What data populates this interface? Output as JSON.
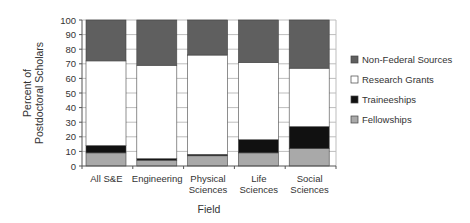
{
  "chart_data": {
    "type": "bar",
    "stacked": true,
    "title": "",
    "xlabel": "Field",
    "ylabel": "Percent of Postdoctoral Scholars",
    "ylabel_lines": [
      "Percent of",
      "Postdoctoral Scholars"
    ],
    "ylim": [
      0,
      100
    ],
    "yticks": [
      0,
      10,
      20,
      30,
      40,
      50,
      60,
      70,
      80,
      90,
      100
    ],
    "grid": true,
    "legend_position": "right",
    "categories": [
      "All S&E",
      "Engineering",
      "Physical Sciences",
      "Life Sciences",
      "Social Sciences"
    ],
    "category_lines": [
      [
        "All S&E"
      ],
      [
        "Engineering"
      ],
      [
        "Physical",
        "Sciences"
      ],
      [
        "Life",
        "Sciences"
      ],
      [
        "Social",
        "Sciences"
      ]
    ],
    "series": [
      {
        "name": "Fellowships",
        "color": "#a9a9a9",
        "values": [
          9,
          4,
          7,
          9,
          12
        ]
      },
      {
        "name": "Traineeships",
        "color": "#111111",
        "values": [
          5,
          1,
          1,
          9,
          15
        ]
      },
      {
        "name": "Research Grants",
        "color": "#ffffff",
        "values": [
          58,
          64,
          68,
          53,
          40
        ]
      },
      {
        "name": "Non-Federal Sources",
        "color": "#5f5f5f",
        "values": [
          28,
          31,
          24,
          29,
          33
        ]
      }
    ],
    "legend_order": [
      "Non-Federal Sources",
      "Research Grants",
      "Traineeships",
      "Fellowships"
    ]
  }
}
